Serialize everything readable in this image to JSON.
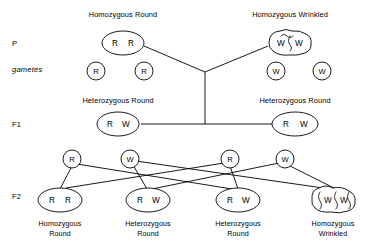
{
  "diagram": {
    "generations": [
      {
        "key": "p",
        "label": "P"
      },
      {
        "key": "gametes",
        "label": "gametes"
      },
      {
        "key": "f1",
        "label": "F1"
      },
      {
        "key": "f2",
        "label": "F2"
      }
    ],
    "p_generation": {
      "parents": [
        {
          "caption": "Homozygous Round",
          "genotype": "R R",
          "allele_left": "R",
          "allele_right": "R",
          "phenotype": "round",
          "shape": "ellipse"
        },
        {
          "caption": "Homozygous Wrinkled",
          "genotype": "W W",
          "allele_left": "W",
          "allele_right": "W",
          "phenotype": "wrinkled",
          "shape": "wrinkled-ellipse"
        }
      ]
    },
    "p_gametes": [
      {
        "allele": "R"
      },
      {
        "allele": "R"
      },
      {
        "allele": "W"
      },
      {
        "allele": "W"
      }
    ],
    "f1_generation": {
      "offspring": [
        {
          "caption": "Heterozygous Round",
          "genotype": "R W",
          "allele_left": "R",
          "allele_right": "W",
          "phenotype": "round",
          "shape": "ellipse"
        },
        {
          "caption": "Heterozygous Round",
          "genotype": "R W",
          "allele_left": "R",
          "allele_right": "W",
          "phenotype": "round",
          "shape": "ellipse"
        }
      ]
    },
    "f1_gametes": [
      {
        "allele": "R"
      },
      {
        "allele": "W"
      },
      {
        "allele": "R"
      },
      {
        "allele": "W"
      }
    ],
    "f2_generation": {
      "offspring": [
        {
          "caption_line1": "Homozygous",
          "caption_line2": "Round",
          "genotype": "R R",
          "allele_left": "R",
          "allele_right": "R",
          "phenotype": "round",
          "shape": "ellipse"
        },
        {
          "caption_line1": "Heterozygous",
          "caption_line2": "Round",
          "genotype": "R W",
          "allele_left": "R",
          "allele_right": "W",
          "phenotype": "round",
          "shape": "ellipse"
        },
        {
          "caption_line1": "Heterozygous",
          "caption_line2": "Round",
          "genotype": "R W",
          "allele_left": "R",
          "allele_right": "W",
          "phenotype": "round",
          "shape": "ellipse"
        },
        {
          "caption_line1": "Homozygous",
          "caption_line2": "Wrinkled",
          "genotype": "W W",
          "allele_left": "W",
          "allele_right": "W",
          "phenotype": "wrinkled",
          "shape": "wrinkled-ellipse"
        }
      ]
    },
    "colors": {
      "ink": "#000000",
      "paper": "#ffffff"
    }
  }
}
